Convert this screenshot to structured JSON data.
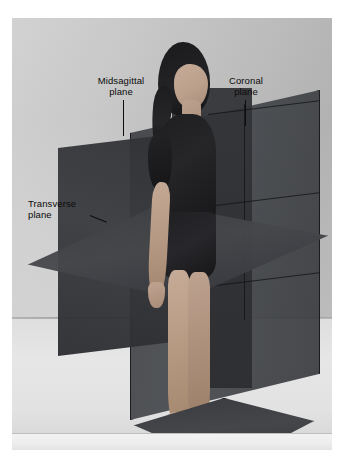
{
  "figure": {
    "photo": {
      "background": "grey-studio-backdrop",
      "background_color": "#bdbdbd",
      "floor_color": "#e2e2e2",
      "border_color": "#ffffff"
    },
    "labels": [
      {
        "id": "midsagittal",
        "text": "Midsagittal\nplane",
        "line1": "Midsagittal",
        "line2": "plane",
        "leader": "vertical-line-down"
      },
      {
        "id": "coronal",
        "text": "Coronal\nplane",
        "line1": "Coronal",
        "line2": "plane",
        "leader": "vertical-line-down"
      },
      {
        "id": "transverse",
        "text": "Transverse\nplane",
        "line1": "Transverse",
        "line2": "plane",
        "leader": "short-diagonal-dash"
      }
    ],
    "planes": [
      {
        "id": "midsagittal",
        "name": "Midsagittal plane",
        "orientation": "vertical-front-facing",
        "color": "#303134",
        "description": "Divides the body into left and right halves"
      },
      {
        "id": "coronal",
        "name": "Coronal plane",
        "orientation": "vertical-receding-right",
        "color": "#42454a",
        "description": "Divides the body into anterior and posterior portions"
      },
      {
        "id": "transverse",
        "name": "Transverse plane",
        "orientation": "horizontal-diamond",
        "color": "#3d3e42",
        "description": "Divides the body into superior and inferior portions"
      }
    ],
    "person": {
      "pose": "standing-upright",
      "hair_color": "#1a1a1c",
      "garment_color": "#1e1e21",
      "skin_color": "#bda290",
      "stands_on": "dark-square-platform",
      "platform_color": "#3a3b3f"
    }
  }
}
